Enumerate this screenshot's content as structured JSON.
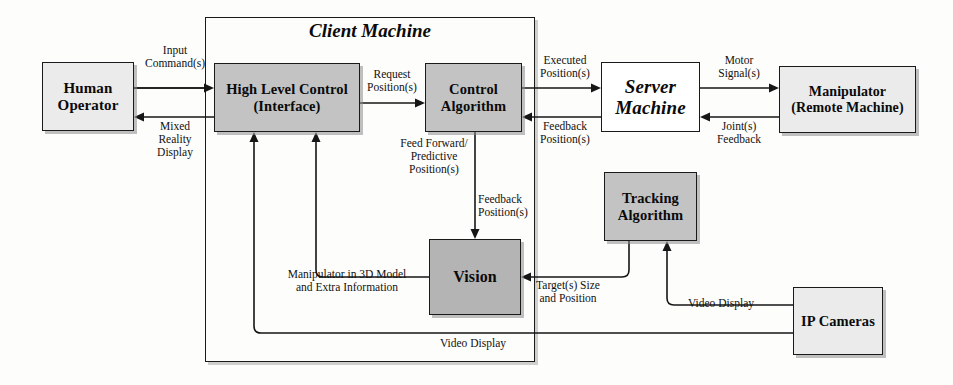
{
  "diagram": {
    "container": {
      "label": "Client Machine"
    },
    "nodes": [
      {
        "id": "human-operator",
        "label": "Human\nOperator"
      },
      {
        "id": "high-level-control",
        "label": "High Level Control\n(Interface)"
      },
      {
        "id": "control-algorithm",
        "label": "Control\nAlgorithm"
      },
      {
        "id": "server-machine",
        "label": "Server\nMachine"
      },
      {
        "id": "manipulator",
        "label": "Manipulator\n(Remote Machine)"
      },
      {
        "id": "vision",
        "label": "Vision"
      },
      {
        "id": "tracking-algorithm",
        "label": "Tracking\nAlgorithm"
      },
      {
        "id": "ip-cameras",
        "label": "IP Cameras"
      }
    ],
    "edges": [
      {
        "id": "input-commands",
        "label": "Input\nCommand(s)",
        "from": "human-operator",
        "to": "high-level-control"
      },
      {
        "id": "mixed-reality",
        "label": "Mixed\nReality\nDisplay",
        "from": "high-level-control",
        "to": "human-operator"
      },
      {
        "id": "request-positions",
        "label": "Request\nPosition(s)",
        "from": "high-level-control",
        "to": "control-algorithm"
      },
      {
        "id": "executed-positions",
        "label": "Executed\nPosition(s)",
        "from": "control-algorithm",
        "to": "server-machine"
      },
      {
        "id": "feedback-positions-server",
        "label": "Feedback\nPosition(s)",
        "from": "server-machine",
        "to": "control-algorithm"
      },
      {
        "id": "motor-signals",
        "label": "Motor\nSignal(s)",
        "from": "server-machine",
        "to": "manipulator"
      },
      {
        "id": "joints-feedback",
        "label": "Joint(s)\nFeedback",
        "from": "manipulator",
        "to": "server-machine"
      },
      {
        "id": "feed-forward",
        "label": "Feed Forward/\nPredictive\nPosition(s)",
        "from": "control-algorithm",
        "to": "vision"
      },
      {
        "id": "feedback-positions-vision",
        "label": "Feedback\nPosition(s)",
        "from": "control-algorithm",
        "to": "vision"
      },
      {
        "id": "manipulator-3d",
        "label": "Manipulator in 3D Model\nand Extra Information",
        "from": "vision",
        "to": "high-level-control"
      },
      {
        "id": "targets-size",
        "label": "Target(s) Size\nand Position",
        "from": "tracking-algorithm",
        "to": "vision"
      },
      {
        "id": "video-display-cameras",
        "label": "Video Display",
        "from": "ip-cameras",
        "to": "tracking-algorithm"
      },
      {
        "id": "video-display-client",
        "label": "Video Display",
        "from": "ip-cameras",
        "to": "high-level-control"
      }
    ],
    "colors": {
      "node_light": "#ebebeb",
      "node_mid": "#c3c3c3",
      "node_dark": "#b4b4b4",
      "node_white": "#ffffff",
      "stroke": "#161616"
    }
  }
}
